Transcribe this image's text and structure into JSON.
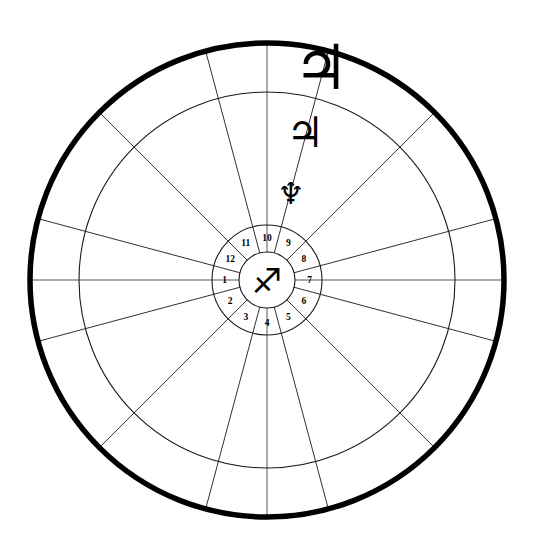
{
  "chart_data": {
    "type": "pie",
    "subtitle": "",
    "xlabel": "",
    "ylabel": "",
    "legend_position": "none",
    "grid": false,
    "center_x": 267,
    "center_y": 280,
    "rings": [
      {
        "name": "outer-zodiac-ring",
        "radius": 237,
        "stroke_width": 5.5,
        "color": "#000000"
      },
      {
        "name": "inner-zodiac-ring",
        "radius": 188,
        "stroke_width": 1.1,
        "color": "#1a1a1a"
      },
      {
        "name": "house-wheel-outer-ring",
        "radius": 55,
        "stroke_width": 1.1,
        "color": "#1a1a1a"
      },
      {
        "name": "house-wheel-inner-ring",
        "radius": 28,
        "stroke_width": 1.1,
        "color": "#1a1a1a"
      }
    ],
    "spoke_count": 12,
    "spoke_angles_deg": [
      0,
      30,
      60,
      90,
      120,
      150,
      180,
      210,
      240,
      270,
      300,
      330
    ],
    "house_cusp_offset_deg": 15,
    "categories": [
      "1",
      "2",
      "3",
      "4",
      "5",
      "6",
      "7",
      "8",
      "9",
      "10",
      "11",
      "12"
    ],
    "values": [
      30,
      30,
      30,
      30,
      30,
      30,
      30,
      30,
      30,
      30,
      30,
      30
    ],
    "axis_lines": [
      "horizontal-axis",
      "vertical-axis"
    ]
  },
  "wheel": {
    "center_sign": {
      "name": "sagittarius-glyph",
      "glyph": "♐",
      "label": "Sagittarius",
      "font_size": 34
    },
    "houses": [
      {
        "number": "1",
        "angle_deg": 180,
        "label": "house-1"
      },
      {
        "number": "2",
        "angle_deg": 210,
        "label": "house-2"
      },
      {
        "number": "3",
        "angle_deg": 240,
        "label": "house-3"
      },
      {
        "number": "4",
        "angle_deg": 270,
        "label": "house-4"
      },
      {
        "number": "5",
        "angle_deg": 300,
        "label": "house-5"
      },
      {
        "number": "6",
        "angle_deg": 330,
        "label": "house-6"
      },
      {
        "number": "7",
        "angle_deg": 0,
        "label": "house-7"
      },
      {
        "number": "8",
        "angle_deg": 30,
        "label": "house-8"
      },
      {
        "number": "9",
        "angle_deg": 60,
        "label": "house-9"
      },
      {
        "number": "10",
        "angle_deg": 90,
        "label": "house-10"
      },
      {
        "number": "11",
        "angle_deg": 120,
        "label": "house-11"
      },
      {
        "number": "12",
        "angle_deg": 150,
        "label": "house-12"
      }
    ]
  },
  "planets": [
    {
      "name": "jupiter-outer",
      "glyph": "♃",
      "label": "Jupiter",
      "x": 321,
      "y": 67,
      "font_size": 62
    },
    {
      "name": "jupiter-inner",
      "glyph": "♃",
      "label": "Jupiter",
      "x": 305,
      "y": 132,
      "font_size": 42
    },
    {
      "name": "neptune",
      "glyph": "♆",
      "label": "Neptune",
      "x": 291,
      "y": 193,
      "font_size": 30
    }
  ],
  "colors": {
    "background": "#ffffff",
    "ink": "#000000",
    "thin_line": "#1a1a1a",
    "axis_line": "#555555"
  }
}
